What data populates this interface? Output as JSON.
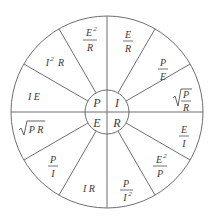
{
  "diagram": {
    "colors": {
      "stroke": "#6e6e6e",
      "text": "#3a3a3a",
      "background": "#ffffff"
    },
    "center": {
      "P": "P",
      "I": "I",
      "E": "E",
      "R": "R"
    },
    "sectors": [
      {
        "quadrant": "I",
        "type": "frac",
        "num": "E",
        "den": "R"
      },
      {
        "quadrant": "I",
        "type": "frac",
        "num": "P",
        "den": "E"
      },
      {
        "quadrant": "I",
        "type": "sqrtfrac",
        "num": "P",
        "den": "R"
      },
      {
        "quadrant": "R",
        "type": "frac",
        "num": "E",
        "den": "I"
      },
      {
        "quadrant": "R",
        "type": "fracsup",
        "num": "E",
        "numsup": "2",
        "den": "P"
      },
      {
        "quadrant": "R",
        "type": "fracdensup",
        "num": "P",
        "den": "I",
        "densup": "2"
      },
      {
        "quadrant": "E",
        "type": "text",
        "text": "I R"
      },
      {
        "quadrant": "E",
        "type": "frac",
        "num": "P",
        "den": "I"
      },
      {
        "quadrant": "E",
        "type": "sqrt",
        "text": "P R"
      },
      {
        "quadrant": "P",
        "type": "text",
        "text": "I E"
      },
      {
        "quadrant": "P",
        "type": "sup",
        "base": "I",
        "sup": "2",
        "rest": "R"
      },
      {
        "quadrant": "P",
        "type": "fracsup",
        "num": "E",
        "numsup": "2",
        "den": "R"
      }
    ]
  }
}
